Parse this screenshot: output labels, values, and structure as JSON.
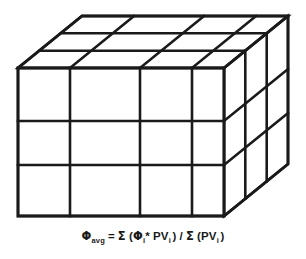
{
  "figure": {
    "name": "porosity-weighted-average-grid-block",
    "background_color": "#ffffff",
    "line_color": "#1a1a1a",
    "caption_color": "#1a1a1a"
  },
  "cube": {
    "description": "3D reservoir grid block drawn in oblique projection, subdivided into cells",
    "front_face": {
      "columns": 4,
      "rows": 3,
      "left_x": 18,
      "right_x": 224,
      "top_y": 68,
      "bottom_y": 216,
      "column_divider_x": [
        70,
        140,
        192
      ],
      "row_divider_y": [
        121,
        165
      ]
    },
    "depth": {
      "slices": 3,
      "offset_x": 64,
      "offset_y": -52
    }
  },
  "caption": {
    "phi_symbol": "Φ",
    "phi_avg_subscript": "avg",
    "equals": "=",
    "sigma_symbol": "Σ",
    "open_paren": "(",
    "close_paren": ")",
    "asterisk": "*",
    "index_subscript": "i",
    "pv_label": "PV",
    "divide": "/",
    "full_text": "Φavg = Σ (Φi* PVi ) / Σ (PVi )"
  }
}
